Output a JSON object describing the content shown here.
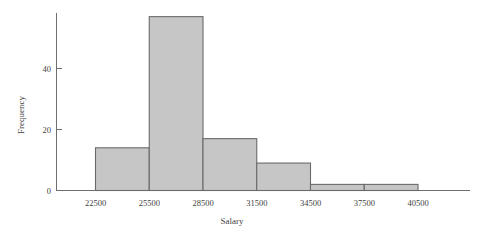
{
  "chart_data": {
    "type": "bar",
    "title": "",
    "subtitle": "",
    "xlabel": "Salary",
    "ylabel": "Frequency",
    "grid": false,
    "legend": false,
    "legend_position": "none",
    "bin_width": 3000,
    "bin_edges": [
      22500,
      25500,
      28500,
      31500,
      34500,
      37500,
      40500
    ],
    "categories": [
      "22500-25500",
      "25500-28500",
      "28500-31500",
      "31500-34500",
      "34500-37500",
      "37500-40500"
    ],
    "values": [
      14,
      57,
      17,
      9,
      2,
      2
    ],
    "xlim": [
      22500,
      40500
    ],
    "ylim": [
      0,
      60
    ],
    "x_ticks": [
      22500,
      25500,
      28500,
      31500,
      34500,
      37500,
      40500
    ],
    "x_tick_labels": [
      "22500",
      "25500",
      "28500",
      "31500",
      "34500",
      "37500",
      "40500"
    ],
    "y_ticks": [
      0,
      20,
      40
    ],
    "y_tick_labels": [
      "0",
      "20",
      "40"
    ],
    "bar_fill_color": "#c6c6c6",
    "bar_edge_color": "#6a6a6a",
    "axis_color": "#6e6e6e"
  }
}
